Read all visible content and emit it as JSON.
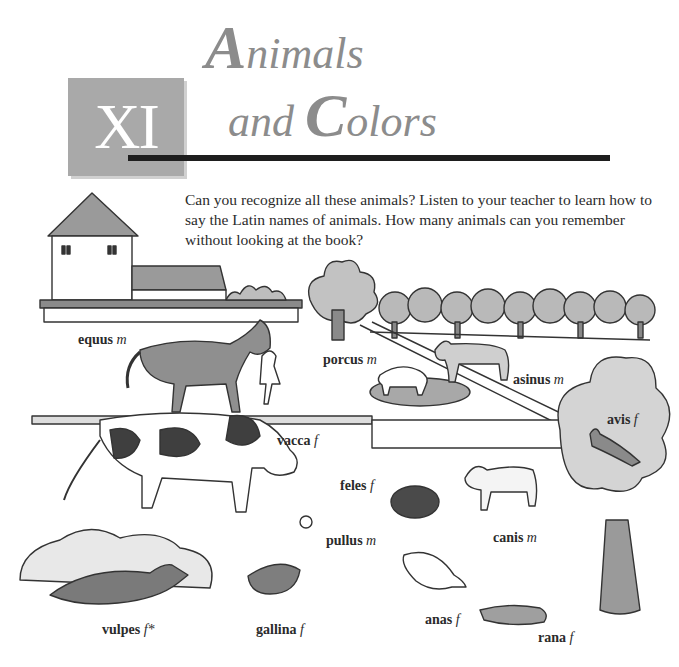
{
  "chapter": {
    "number": "XI",
    "title_line1_cap": "A",
    "title_line1_rest": "nimals",
    "title_line2_pre": "and ",
    "title_line2_cap": "C",
    "title_line2_rest": "olors"
  },
  "intro_text": "Can you recognize all these animals? Listen to your teacher to learn how to say the Latin names of animals. How many animals can you remember without looking at the book?",
  "colors": {
    "chapter_box": "#a9a9a9",
    "title_gray": "#8c8c8c",
    "rule": "#1e1e1e"
  },
  "labels": [
    {
      "id": "equus",
      "word": "equus",
      "gender": "m"
    },
    {
      "id": "porcus",
      "word": "porcus",
      "gender": "m"
    },
    {
      "id": "asinus",
      "word": "asinus",
      "gender": "m"
    },
    {
      "id": "avis",
      "word": "avis",
      "gender": "f"
    },
    {
      "id": "vacca",
      "word": "vacca",
      "gender": "f"
    },
    {
      "id": "feles",
      "word": "feles",
      "gender": "f"
    },
    {
      "id": "pullus",
      "word": "pullus",
      "gender": "m"
    },
    {
      "id": "canis",
      "word": "canis",
      "gender": "m"
    },
    {
      "id": "vulpes",
      "word": "vulpes",
      "gender": "f*"
    },
    {
      "id": "gallina",
      "word": "gallina",
      "gender": "f"
    },
    {
      "id": "anas",
      "word": "anas",
      "gender": "f"
    },
    {
      "id": "rana",
      "word": "rana",
      "gender": "f"
    }
  ]
}
